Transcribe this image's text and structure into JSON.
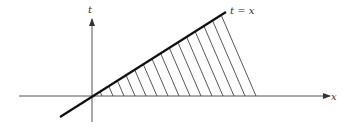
{
  "diagram": {
    "labels": {
      "t_axis": "t",
      "x_axis": "x",
      "line": "t = x"
    },
    "colors": {
      "background": "#ffffff",
      "axis": "#555555",
      "line": "#111111",
      "hatch": "#444444",
      "text": "#333333"
    },
    "geometry": {
      "origin": [
        92,
        96
      ],
      "x_axis": {
        "from": 19,
        "to": 330
      },
      "t_axis": {
        "from": 122,
        "to": 18
      },
      "line": {
        "from": [
          60,
          117
        ],
        "to": [
          226,
          12
        ]
      },
      "hatch_count": 15,
      "hatch_x_start": 102,
      "hatch_x_end": 256
    }
  }
}
